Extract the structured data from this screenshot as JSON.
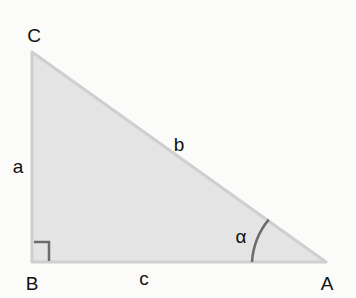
{
  "diagram": {
    "type": "right-triangle",
    "colors": {
      "background": "#fbfbfa",
      "fill": "#e4e4e4",
      "stroke": "#cfcfcf",
      "marker": "#6b6b6b",
      "text": "#111111"
    },
    "vertices": {
      "C": {
        "label": "C",
        "x": 32,
        "y": 52,
        "label_x": 34,
        "label_y": 35
      },
      "B": {
        "label": "B",
        "x": 32,
        "y": 262,
        "label_x": 32,
        "label_y": 283
      },
      "A": {
        "label": "A",
        "x": 326,
        "y": 262,
        "label_x": 327,
        "label_y": 283
      }
    },
    "sides": {
      "a": {
        "label": "a",
        "between": "B-C",
        "label_x": 18,
        "label_y": 167
      },
      "b": {
        "label": "b",
        "between": "C-A",
        "label_x": 179,
        "label_y": 145
      },
      "c": {
        "label": "c",
        "between": "B-A",
        "label_x": 144,
        "label_y": 279
      }
    },
    "angles": {
      "alpha": {
        "label": "α",
        "at": "A",
        "label_x": 241,
        "label_y": 237
      },
      "right_angle": {
        "at": "B"
      }
    }
  }
}
